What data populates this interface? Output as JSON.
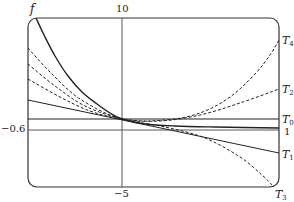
{
  "chart_data": {
    "type": "line",
    "title": "",
    "xlabel": "",
    "ylabel": "f",
    "axis_labels": {
      "vertical_line_top": "10",
      "vertical_line_bottom": "-5",
      "horizontal_line_left": "-0.6",
      "horizontal_line_right": "1"
    },
    "frame": {
      "left": 28,
      "right": 279,
      "top": 18,
      "bottom": 187,
      "radius": 9
    },
    "reference_lines": {
      "vertical_x": 122,
      "horizontal_upper_y": 119,
      "horizontal_lower_y": 130
    },
    "series": [
      {
        "name": "f",
        "style": "solid",
        "points": [
          [
            36,
            18
          ],
          [
            44,
            35
          ],
          [
            55,
            56
          ],
          [
            68,
            76
          ],
          [
            82,
            92
          ],
          [
            97,
            104
          ],
          [
            110,
            113
          ],
          [
            122,
            119
          ],
          [
            145,
            124
          ],
          [
            175,
            126
          ],
          [
            215,
            127
          ],
          [
            279,
            128
          ]
        ]
      },
      {
        "name": "T0",
        "style": "solid",
        "points": [
          [
            28,
            119
          ],
          [
            279,
            119
          ]
        ]
      },
      {
        "name": "T1",
        "style": "solid",
        "points": [
          [
            28,
            100
          ],
          [
            279,
            153
          ]
        ]
      },
      {
        "name": "T2",
        "style": "dashed",
        "points": [
          [
            28,
            79
          ],
          [
            60,
            97
          ],
          [
            90,
            111
          ],
          [
            122,
            119
          ],
          [
            160,
            121
          ],
          [
            200,
            115
          ],
          [
            240,
            103
          ],
          [
            279,
            89
          ]
        ]
      },
      {
        "name": "T3",
        "style": "dashed",
        "points": [
          [
            28,
            64
          ],
          [
            55,
            86
          ],
          [
            85,
            106
          ],
          [
            122,
            119
          ],
          [
            165,
            127
          ],
          [
            205,
            138
          ],
          [
            240,
            157
          ],
          [
            262,
            175
          ],
          [
            274,
            187
          ]
        ]
      },
      {
        "name": "T4",
        "style": "dashed",
        "points": [
          [
            28,
            48
          ],
          [
            50,
            72
          ],
          [
            80,
            99
          ],
          [
            122,
            119
          ],
          [
            165,
            120
          ],
          [
            200,
            113
          ],
          [
            230,
            97
          ],
          [
            255,
            74
          ],
          [
            270,
            55
          ],
          [
            279,
            40
          ]
        ]
      }
    ],
    "legend": [
      {
        "label": "T4",
        "x": 283,
        "y": 42
      },
      {
        "label": "T2",
        "x": 283,
        "y": 91
      },
      {
        "label": "T0",
        "x": 283,
        "y": 121
      },
      {
        "label": "1",
        "x": 283,
        "y": 132
      },
      {
        "label": "T1",
        "x": 283,
        "y": 155
      },
      {
        "label": "T3",
        "x": 276,
        "y": 196
      }
    ],
    "grid": false
  },
  "labels": {
    "f": "f",
    "ten": "10",
    "minus_five": "−5",
    "minus_point_six": "−0.6",
    "one": "1",
    "T": "T",
    "sub0": "0",
    "sub1": "1",
    "sub2": "2",
    "sub3": "3",
    "sub4": "4"
  }
}
